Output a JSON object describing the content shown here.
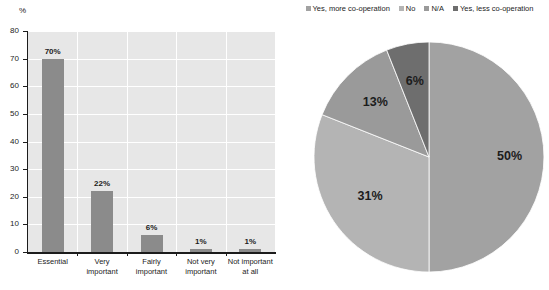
{
  "chart_data": [
    {
      "type": "bar",
      "title": "",
      "xlabel": "",
      "ylabel": "%",
      "ylim": [
        0,
        80
      ],
      "grid": true,
      "categories": [
        "Essential",
        "Very important",
        "Fairly important",
        "Not very important",
        "Not important at all"
      ],
      "category_lines": [
        [
          "Essential"
        ],
        [
          "Very",
          "important"
        ],
        [
          "Fairly",
          "important"
        ],
        [
          "Not very",
          "important"
        ],
        [
          "Not important",
          "at all"
        ]
      ],
      "values": [
        70,
        22,
        6,
        1,
        1
      ],
      "value_labels": [
        "70%",
        "22%",
        "6%",
        "1%",
        "1%"
      ],
      "ytick_labels": [
        "80",
        "70",
        "60",
        "50",
        "40",
        "30",
        "20",
        "10",
        "0"
      ],
      "yticks": [
        80,
        70,
        60,
        50,
        40,
        30,
        20,
        10,
        0
      ],
      "bar_color": "#8b8b8b",
      "plot_background": "#e7e7e7",
      "gridline_color": "#ffffff"
    },
    {
      "type": "pie",
      "title": "",
      "legend_position": "top",
      "labels": [
        "Yes, more co-operation",
        "No",
        "N/A",
        "Yes, less co-operation"
      ],
      "values": [
        50,
        31,
        13,
        6
      ],
      "value_labels": [
        "50%",
        "31%",
        "13%",
        "6%"
      ],
      "colors": [
        "#a2a2a2",
        "#b4b4b4",
        "#9a9a9a",
        "#6e6e6e"
      ]
    }
  ],
  "bar": {
    "axis_unit": "%"
  }
}
